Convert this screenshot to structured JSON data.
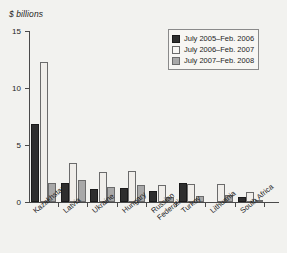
{
  "chart_data": {
    "type": "bar",
    "title": "",
    "ylabel": "$ billions",
    "xlabel": "",
    "ylim": [
      0,
      15
    ],
    "yticks": [
      0,
      5,
      10,
      15
    ],
    "ytick_labels": [
      "0",
      "5",
      "10",
      "15"
    ],
    "grid": false,
    "legend_position": "top-right",
    "categories": [
      "Kazakhstan",
      "Latvia",
      "Ukraine",
      "Hungary",
      "Russian\nFederation",
      "Turkey",
      "Lithuania",
      "South Africa"
    ],
    "series": [
      {
        "name": "July 2005–Feb. 2006",
        "color": "#2e2e2e",
        "values": [
          6.8,
          1.7,
          1.1,
          1.25,
          1.0,
          1.65,
          0.0,
          0.4
        ]
      },
      {
        "name": "July 2006–Feb. 2007",
        "color": "#f0eeea",
        "values": [
          12.3,
          3.4,
          2.6,
          2.75,
          1.5,
          1.6,
          1.55,
          0.85
        ]
      },
      {
        "name": "July 2007–Feb. 2008",
        "color": "#a8a8a8",
        "values": [
          1.7,
          1.9,
          1.35,
          1.5,
          0.4,
          0.55,
          0.65,
          0.15
        ]
      }
    ]
  },
  "legend": {
    "entries": [
      "July 2005–Feb. 2006",
      "July 2006–Feb. 2007",
      "July 2007–Feb. 2008"
    ]
  },
  "axis": {
    "ylabel": "$ billions",
    "ytick_labels": [
      "15",
      "10",
      "5",
      "0"
    ]
  },
  "categories_display": [
    {
      "lines": [
        "Kazakhstan"
      ]
    },
    {
      "lines": [
        "Latvia"
      ]
    },
    {
      "lines": [
        "Ukraine"
      ]
    },
    {
      "lines": [
        "Hungary"
      ]
    },
    {
      "lines": [
        "Russian",
        "Federation"
      ]
    },
    {
      "lines": [
        "Turkey"
      ]
    },
    {
      "lines": [
        "Lithuania"
      ]
    },
    {
      "lines": [
        "South Africa"
      ]
    }
  ]
}
